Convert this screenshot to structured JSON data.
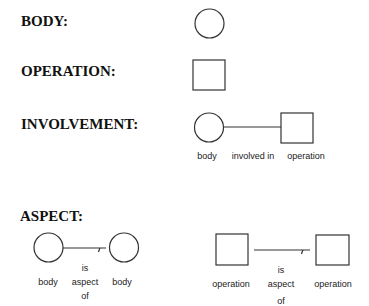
{
  "headings": {
    "body": "BODY:",
    "operation": "OPERATION:",
    "involvement": "INVOLVEMENT:",
    "aspect": "ASPECT:"
  },
  "involvement": {
    "left_label": "body",
    "relation_label": "involved in",
    "right_label": "operation"
  },
  "aspect_body": {
    "left_label": "body",
    "relation_top": "is",
    "relation_mid": "aspect",
    "relation_bottom": "of",
    "right_label": "body"
  },
  "aspect_operation": {
    "left_label": "operation",
    "relation_top": "is",
    "relation_mid": "aspect",
    "relation_bottom": "of",
    "right_label": "operation"
  },
  "colors": {
    "ink": "#333333",
    "background": "#ffffff"
  }
}
